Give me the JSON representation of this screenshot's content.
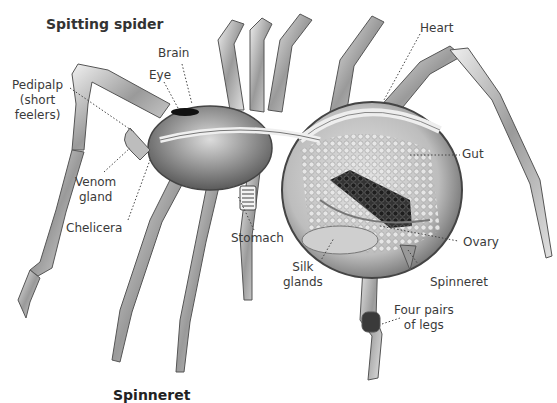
{
  "title": "Spitting spider",
  "labels": {
    "brain": "Brain",
    "eye": "Eye",
    "pedipalp_line1": "Pedipalp",
    "pedipalp_line2": "(short",
    "pedipalp_line3": "feelers)",
    "venom_line1": "Venom",
    "venom_line2": "gland",
    "chelicera": "Chelicera",
    "heart": "Heart",
    "gut": "Gut",
    "stomach": "Stomach",
    "silk_line1": "Silk",
    "silk_line2": "glands",
    "ovary": "Ovary",
    "spinneret": "Spinneret",
    "legs_line1": "Four pairs",
    "legs_line2": "of legs"
  },
  "cut_off_heading": "Spinneret",
  "colors": {
    "background": "#ffffff",
    "label_text": "#3a3a3a",
    "leader_line": "#444444",
    "body_light": "#d9d9d9",
    "body_dark": "#4a4a4a"
  }
}
